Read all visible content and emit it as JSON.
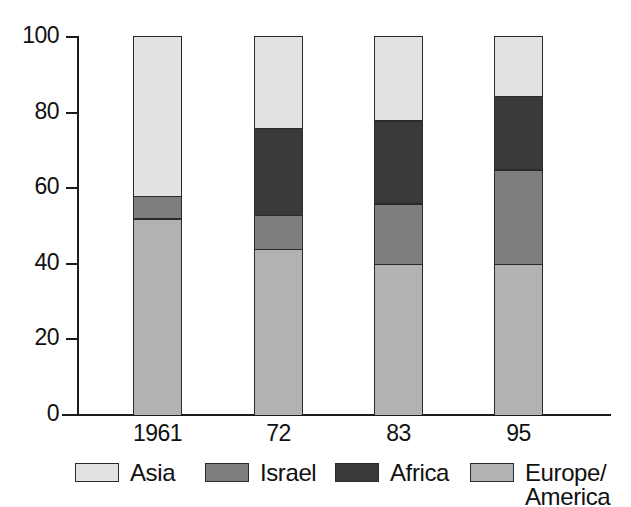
{
  "chart_data": {
    "type": "bar",
    "subtype": "stacked-100",
    "title": "",
    "subtitle": "",
    "xlabel": "",
    "ylabel": "",
    "categories": [
      "1961",
      "72",
      "83",
      "95"
    ],
    "ylim": [
      0,
      100
    ],
    "yticks": [
      0,
      20,
      40,
      60,
      80,
      100
    ],
    "ytick_labels": [
      "0",
      "20",
      "40",
      "60",
      "80",
      "100"
    ],
    "grid": false,
    "legend_position": "bottom",
    "stack_order_bottom_to_top": [
      "Europe/America",
      "Israel",
      "Africa",
      "Asia"
    ],
    "series": [
      {
        "name": "Europe/America",
        "color": "#b2b2b2",
        "values": [
          52,
          44,
          40,
          40
        ]
      },
      {
        "name": "Israel",
        "color": "#7e7e7e",
        "values": [
          6,
          9,
          16,
          25
        ]
      },
      {
        "name": "Africa",
        "color": "#3a3a3a",
        "values": [
          0,
          23,
          22,
          19.5
        ]
      },
      {
        "name": "Asia",
        "color": "#e2e2e2",
        "values": [
          42,
          24,
          22,
          15.5
        ]
      }
    ],
    "cumulative_tops": {
      "1961": {
        "Europe/America": 52,
        "Israel": 58,
        "Africa": 58,
        "Asia": 100
      },
      "72": {
        "Europe/America": 44,
        "Israel": 53,
        "Africa": 76,
        "Asia": 100
      },
      "83": {
        "Europe/America": 40,
        "Israel": 56,
        "Africa": 78,
        "Asia": 100
      },
      "95": {
        "Europe/America": 40,
        "Israel": 65,
        "Africa": 84.5,
        "Asia": 100
      }
    }
  },
  "legend": {
    "items": [
      {
        "label": "Asia",
        "color": "#e2e2e2"
      },
      {
        "label": "Israel",
        "color": "#7e7e7e"
      },
      {
        "label": "Africa",
        "color": "#3a3a3a"
      },
      {
        "label": "Europe/\nAmerica",
        "color": "#b2b2b2"
      }
    ]
  },
  "axis_colors": {
    "line": "#1b1b1b",
    "text": "#111111",
    "bar_outline": "#2a2a2a",
    "background": "#ffffff"
  }
}
